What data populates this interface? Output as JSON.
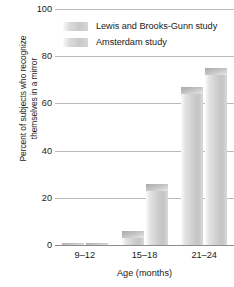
{
  "chart_data": {
    "type": "bar",
    "title": "",
    "xlabel": "Age (months)",
    "ylabel": "Percent of subjects who recognize\nthemselves in a mirror",
    "categories": [
      "9–12",
      "15–18",
      "21–24"
    ],
    "series": [
      {
        "name": "Lewis and Brooks-Gunn study",
        "values": [
          1,
          6,
          67
        ]
      },
      {
        "name": "Amsterdam study",
        "values": [
          1,
          26,
          75
        ]
      }
    ],
    "ylim": [
      0,
      100
    ],
    "yticks": [
      0,
      20,
      40,
      60,
      80,
      100
    ],
    "ytick_labels": [
      "0",
      "20",
      "40",
      "60",
      "80",
      "100"
    ],
    "grid": true,
    "legend_position": "top-left",
    "colors": {
      "bar_light": "#e3e3e3",
      "bar_mid": "#cfcfcf",
      "bar_cap": "#b4b4b4",
      "gridline": "#b9b9b9",
      "axis": "#8d8d8d",
      "text": "#1a1a1a"
    }
  }
}
